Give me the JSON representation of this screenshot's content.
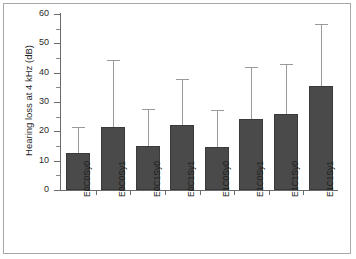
{
  "chart_data": {
    "type": "bar",
    "title": "",
    "xlabel": "",
    "ylabel": "Hearing loss at 4 kHz (dB)",
    "ylim": [
      0,
      60
    ],
    "ytick_values": [
      0,
      10,
      20,
      30,
      40,
      50,
      60
    ],
    "ytick_labels": [
      "0",
      "10",
      "20",
      "30",
      "40",
      "50",
      "60"
    ],
    "yminor_values": [
      5,
      15,
      25,
      35,
      45,
      55
    ],
    "grid": false,
    "legend": "none",
    "error_bars": "upper-only",
    "bar_color": "#4a4a4a",
    "error_color": "#9a9a9a",
    "axis_color": "#6b6b6b",
    "frame_color": "#a8a8a8",
    "categories": [
      "E0C0Sy0",
      "E0C0Sy1",
      "E0C1Sy0",
      "E0C1Sy1",
      "E1C0Sy0",
      "E1C0Sy1",
      "E1C1Sy0",
      "E1C1Sy1"
    ],
    "values": [
      12.7,
      21.4,
      15.1,
      22.1,
      14.5,
      24.1,
      26.0,
      35.4
    ],
    "error_upper": [
      21.5,
      44.4,
      27.5,
      38.0,
      27.4,
      41.9,
      42.8,
      56.6
    ]
  }
}
